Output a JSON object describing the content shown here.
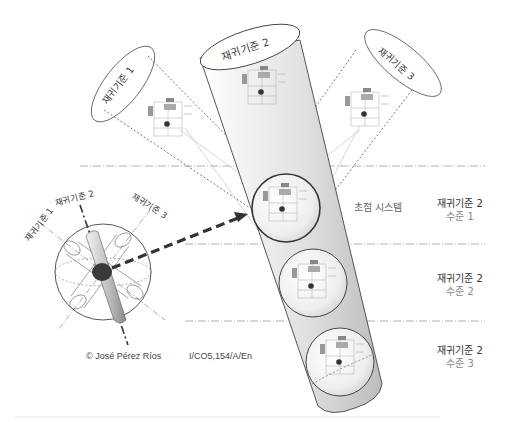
{
  "diagram": {
    "title": "",
    "criteria": {
      "c1": "재귀기준 1",
      "c2": "재귀기준 2",
      "c3": "재귀기준 3"
    },
    "sphere_labels": {
      "c1": "재귀기준 1",
      "c2": "재귀기준 2",
      "c3": "재귀기준 3"
    },
    "focus_label": "초점 시스템",
    "levels": [
      {
        "title": "재귀기준 2",
        "sub": "수준 1"
      },
      {
        "title": "재귀기준 2",
        "sub": "수준 2"
      },
      {
        "title": "재귀기준 2",
        "sub": "수준 3"
      }
    ],
    "credits": {
      "author": "© José Pérez Ríos",
      "code": "I/CO5,154/A/En"
    },
    "colors": {
      "line": "#555555",
      "dash_dot": "#999999",
      "cylinder_fill": "#d6d6d6",
      "focus_dot": "#333333",
      "arrow": "#333333"
    }
  }
}
